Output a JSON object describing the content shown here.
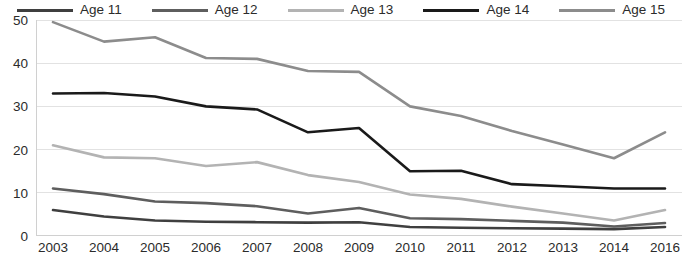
{
  "chart_data": {
    "type": "line",
    "title": "",
    "xlabel": "",
    "ylabel": "",
    "ylim": [
      0,
      50
    ],
    "yticks": [
      0,
      10,
      20,
      30,
      40,
      50
    ],
    "grid": "horizontal",
    "legend_position": "top",
    "categories": [
      "2003",
      "2004",
      "2005",
      "2006",
      "2007",
      "2008",
      "2009",
      "2010",
      "2011",
      "2012",
      "2013",
      "2014",
      "2016"
    ],
    "series": [
      {
        "name": "Age 11",
        "color": "#3f3f3f",
        "values": [
          6,
          4.5,
          3.6,
          3.3,
          3.2,
          3.1,
          3.2,
          2.1,
          1.9,
          1.8,
          1.7,
          1.6,
          2.1
        ]
      },
      {
        "name": "Age 12",
        "color": "#5e5e5e",
        "values": [
          11,
          9.7,
          8,
          7.6,
          6.9,
          5.2,
          6.5,
          4.1,
          3.9,
          3.5,
          3.1,
          2.2,
          3
        ]
      },
      {
        "name": "Age 13",
        "color": "#b3b3b3",
        "values": [
          21,
          18.2,
          18,
          16.2,
          17.1,
          14.1,
          12.5,
          9.6,
          8.6,
          6.8,
          5.2,
          3.6,
          6
        ]
      },
      {
        "name": "Age 14",
        "color": "#1a1a1a",
        "values": [
          33,
          33.1,
          32.3,
          30,
          29.3,
          24,
          25,
          15,
          15.1,
          12,
          11.5,
          11,
          11
        ]
      },
      {
        "name": "Age 15",
        "color": "#8c8c8c",
        "values": [
          49.5,
          45,
          46,
          41.2,
          41,
          38.2,
          38,
          30,
          27.8,
          24.3,
          21.2,
          18,
          24
        ]
      }
    ]
  },
  "legend": {
    "items": [
      {
        "label": "Age 11"
      },
      {
        "label": "Age 12"
      },
      {
        "label": "Age 13"
      },
      {
        "label": "Age 14"
      },
      {
        "label": "Age 15"
      }
    ]
  },
  "axes": {
    "y_labels": [
      "50",
      "40",
      "30",
      "20",
      "10",
      "0"
    ],
    "x_labels": [
      "2003",
      "2004",
      "2005",
      "2006",
      "2007",
      "2008",
      "2009",
      "2010",
      "2011",
      "2012",
      "2013",
      "2014",
      "2016"
    ]
  },
  "style": {
    "gridline_color": "#e2e2e2",
    "axis_color": "#d0d0d0",
    "text_color": "#2b2b2b",
    "background": "#ffffff"
  }
}
